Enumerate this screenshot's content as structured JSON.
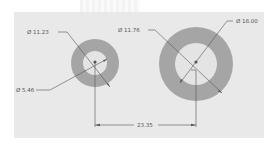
{
  "drawing": {
    "background_color": "#e9e9e9",
    "ring_color": "#a5a5a5",
    "hole_color": "#e4e4e4",
    "line_color": "#555555",
    "diameter_symbol": "Ø",
    "dimensions": [
      {
        "id": "small-outer",
        "label": "Ø 11.23",
        "type": "diameter"
      },
      {
        "id": "small-inner",
        "label": "Ø 5.46",
        "type": "diameter"
      },
      {
        "id": "large-inner",
        "label": "Ø 11.76",
        "type": "diameter"
      },
      {
        "id": "large-outer",
        "label": "Ø 18.00",
        "type": "diameter"
      },
      {
        "id": "center-distance",
        "label": "23.35",
        "type": "linear"
      }
    ]
  }
}
